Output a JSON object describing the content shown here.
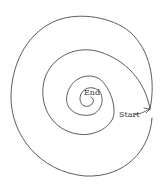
{
  "diagram": {
    "type": "spiral-maze",
    "labels": {
      "start": "Start",
      "end": "End"
    },
    "colors": {
      "stroke": "#4a4a4a",
      "text": "#3a3a3a",
      "background": "#ffffff"
    },
    "geometry_note": "Outer-loop extents measured from zooms; inner loops, End/Start label positions and the arrow tip are approximate estimates from coarse zooms, not measured.",
    "outer_loop_extent": {
      "left": 11,
      "top": 15,
      "right": 153,
      "bottom": 176
    },
    "start_point_approx": [
      150,
      109
    ],
    "end_point_approx": [
      88,
      100
    ]
  }
}
